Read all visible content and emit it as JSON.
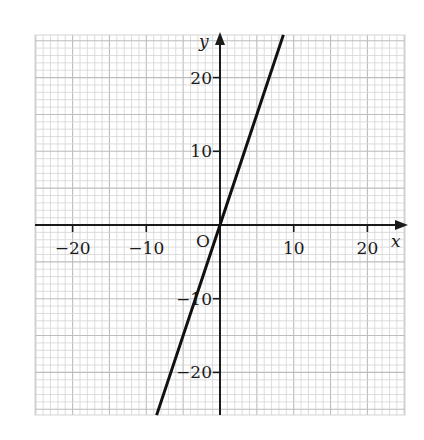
{
  "chart_data": {
    "type": "line",
    "title": "",
    "xlabel": "x",
    "ylabel": "y",
    "origin_label": "O",
    "xlim": [
      -25,
      25
    ],
    "ylim": [
      -26,
      26
    ],
    "grid": true,
    "grid_minor_step": 1,
    "grid_major_step": 5,
    "x_ticks": [
      -20,
      -10,
      10,
      20
    ],
    "y_ticks": [
      20,
      10,
      -10,
      -20
    ],
    "x_tick_labels": [
      "−20",
      "−10",
      "10",
      "20"
    ],
    "y_tick_labels": [
      "20",
      "10",
      "−10",
      "−20"
    ],
    "series": [
      {
        "name": "y = 3x",
        "equation": "y = 3x",
        "points": [
          [
            -8.6,
            -25.8
          ],
          [
            0,
            0
          ],
          [
            8.6,
            25.8
          ]
        ],
        "color": "#111111"
      }
    ],
    "legend": "none"
  },
  "colors": {
    "grid_minor": "#d4d4d4",
    "grid_major": "#bdbdbd",
    "axis": "#1a1a1a",
    "line": "#111111"
  }
}
